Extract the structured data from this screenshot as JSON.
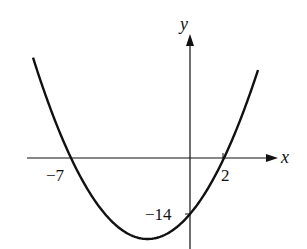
{
  "chart_data": {
    "type": "line",
    "title": "",
    "xlabel": "x",
    "ylabel": "y",
    "function": "y = x^2 + 5x - 14",
    "series": [
      {
        "name": "parabola",
        "x": [
          -9,
          -8,
          -7,
          -6,
          -5,
          -4,
          -3,
          -2.5,
          -2,
          -1,
          0,
          1,
          2,
          3,
          4
        ],
        "values": [
          22,
          10,
          0,
          -8,
          -14,
          -18,
          -20,
          -20.25,
          -20,
          -18,
          -14,
          -8,
          0,
          8,
          22
        ]
      }
    ],
    "annotations": [
      {
        "label": "-7",
        "x": -7,
        "y": 0,
        "meaning": "x-intercept"
      },
      {
        "label": "2",
        "x": 2,
        "y": 0,
        "meaning": "x-intercept"
      },
      {
        "label": "-14",
        "x": 0,
        "y": -14,
        "meaning": "y-intercept"
      }
    ],
    "grid": false,
    "legend": "none"
  },
  "labels": {
    "x_axis": "x",
    "y_axis": "y",
    "x_intercept_left": "−7",
    "x_intercept_right": "2",
    "y_intercept": "−14"
  }
}
